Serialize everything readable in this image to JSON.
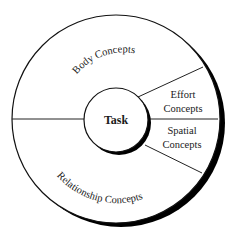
{
  "diagram": {
    "center": {
      "label": "Task"
    },
    "segments": [
      {
        "id": "body",
        "label": "Body Concepts"
      },
      {
        "id": "effort",
        "label_line1": "Effort",
        "label_line2": "Concepts"
      },
      {
        "id": "spatial",
        "label_line1": "Spatial",
        "label_line2": "Concepts"
      },
      {
        "id": "relationship",
        "label": "Relationship Concepts"
      }
    ],
    "colors": {
      "stroke": "#111111",
      "fill": "#ffffff",
      "shadow": "#000000"
    }
  }
}
